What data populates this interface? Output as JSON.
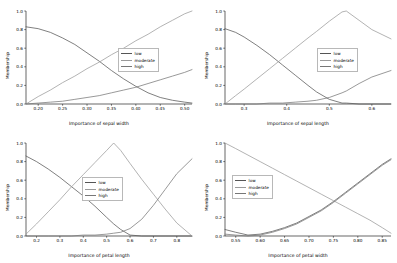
{
  "figure": {
    "background": "#ffffff",
    "layout": "2x2 grid of fuzzy membership function plots"
  },
  "series_colors": {
    "low": "#555555",
    "moderate": "#9a9a9a",
    "high": "#777777"
  },
  "legend_labels": {
    "low": "low",
    "moderate": "moderate",
    "high": "high"
  },
  "chart_data": [
    {
      "id": "top-left",
      "type": "line",
      "title": "",
      "xlabel": "Importance of sepal width",
      "ylabel": "Membership",
      "xlim": [
        0.175,
        0.515
      ],
      "ylim": [
        0.0,
        1.0
      ],
      "xticks": [
        "0.20",
        "0.25",
        "0.30",
        "0.35",
        "0.40",
        "0.45",
        "0.50"
      ],
      "xtick_values": [
        0.2,
        0.25,
        0.3,
        0.35,
        0.4,
        0.45,
        0.5
      ],
      "yticks": [
        "0.0",
        "0.2",
        "0.4",
        "0.6",
        "0.8",
        "1.0"
      ],
      "ytick_values": [
        0.0,
        0.2,
        0.4,
        0.6,
        0.8,
        1.0
      ],
      "grid": false,
      "legend_position": "center-right",
      "x": [
        0.175,
        0.2,
        0.225,
        0.25,
        0.275,
        0.3,
        0.325,
        0.35,
        0.375,
        0.4,
        0.425,
        0.45,
        0.475,
        0.5,
        0.515
      ],
      "series": [
        {
          "name": "low",
          "values": [
            0.83,
            0.81,
            0.77,
            0.71,
            0.64,
            0.55,
            0.46,
            0.36,
            0.27,
            0.19,
            0.12,
            0.07,
            0.04,
            0.02,
            0.01
          ]
        },
        {
          "name": "moderate",
          "values": [
            0.0,
            0.08,
            0.15,
            0.23,
            0.3,
            0.38,
            0.45,
            0.53,
            0.6,
            0.68,
            0.75,
            0.83,
            0.9,
            0.97,
            1.0
          ]
        },
        {
          "name": "high",
          "values": [
            0.0,
            0.01,
            0.02,
            0.03,
            0.05,
            0.07,
            0.09,
            0.12,
            0.15,
            0.18,
            0.22,
            0.26,
            0.3,
            0.34,
            0.37
          ]
        }
      ]
    },
    {
      "id": "top-right",
      "type": "line",
      "title": "",
      "xlabel": "Importance of sepal length",
      "ylabel": "Membership",
      "xlim": [
        0.255,
        0.645
      ],
      "ylim": [
        0.0,
        1.0
      ],
      "xticks": [
        "0.3",
        "0.4",
        "0.5",
        "0.6"
      ],
      "xtick_values": [
        0.3,
        0.4,
        0.5,
        0.6
      ],
      "yticks": [
        "0.0",
        "0.2",
        "0.4",
        "0.6",
        "0.8",
        "1.0"
      ],
      "ytick_values": [
        0.0,
        0.2,
        0.4,
        0.6,
        0.8,
        1.0
      ],
      "grid": false,
      "legend_position": "center-right",
      "x": [
        0.255,
        0.28,
        0.3,
        0.33,
        0.36,
        0.39,
        0.42,
        0.45,
        0.47,
        0.5,
        0.53,
        0.54,
        0.57,
        0.6,
        0.645
      ],
      "series": [
        {
          "name": "low",
          "values": [
            0.81,
            0.77,
            0.72,
            0.63,
            0.53,
            0.42,
            0.31,
            0.2,
            0.13,
            0.05,
            0.01,
            0.01,
            0.0,
            0.0,
            0.0
          ]
        },
        {
          "name": "moderate",
          "values": [
            0.0,
            0.09,
            0.16,
            0.27,
            0.38,
            0.49,
            0.6,
            0.71,
            0.78,
            0.89,
            0.99,
            1.0,
            0.9,
            0.8,
            0.7
          ]
        },
        {
          "name": "high",
          "values": [
            0.0,
            0.0,
            0.0,
            0.0,
            0.01,
            0.01,
            0.02,
            0.03,
            0.04,
            0.07,
            0.12,
            0.14,
            0.22,
            0.29,
            0.36
          ]
        }
      ]
    },
    {
      "id": "bottom-left",
      "type": "line",
      "title": "",
      "xlabel": "Importance of petal length",
      "ylabel": "Membership",
      "xlim": [
        0.155,
        0.865
      ],
      "ylim": [
        0.0,
        1.0
      ],
      "xticks": [
        "0.2",
        "0.3",
        "0.4",
        "0.5",
        "0.6",
        "0.7",
        "0.8"
      ],
      "xtick_values": [
        0.2,
        0.3,
        0.4,
        0.5,
        0.6,
        0.7,
        0.8
      ],
      "yticks": [
        "0.0",
        "0.2",
        "0.4",
        "0.6",
        "0.8",
        "1.0"
      ],
      "ytick_values": [
        0.0,
        0.2,
        0.4,
        0.6,
        0.8,
        1.0
      ],
      "grid": false,
      "legend_position": "center",
      "x": [
        0.155,
        0.2,
        0.25,
        0.3,
        0.35,
        0.4,
        0.45,
        0.5,
        0.53,
        0.56,
        0.6,
        0.65,
        0.7,
        0.75,
        0.8,
        0.865
      ],
      "series": [
        {
          "name": "low",
          "values": [
            0.86,
            0.8,
            0.72,
            0.63,
            0.53,
            0.43,
            0.32,
            0.2,
            0.13,
            0.07,
            0.01,
            0.0,
            0.0,
            0.0,
            0.0,
            0.0
          ]
        },
        {
          "name": "moderate",
          "values": [
            0.02,
            0.13,
            0.26,
            0.39,
            0.53,
            0.66,
            0.79,
            0.92,
            1.0,
            0.92,
            0.78,
            0.61,
            0.45,
            0.29,
            0.14,
            0.0
          ]
        },
        {
          "name": "high",
          "values": [
            0.0,
            0.0,
            0.0,
            0.0,
            0.0,
            0.01,
            0.01,
            0.02,
            0.03,
            0.04,
            0.08,
            0.18,
            0.33,
            0.5,
            0.67,
            0.83
          ]
        }
      ]
    },
    {
      "id": "bottom-right",
      "type": "line",
      "title": "",
      "xlabel": "Importance of petal width",
      "ylabel": "Membership",
      "xlim": [
        0.528,
        0.868
      ],
      "ylim": [
        0.0,
        1.0
      ],
      "xticks": [
        "0.55",
        "0.60",
        "0.65",
        "0.70",
        "0.75",
        "0.80",
        "0.85"
      ],
      "xtick_values": [
        0.55,
        0.6,
        0.65,
        0.7,
        0.75,
        0.8,
        0.85
      ],
      "yticks": [
        "0.0",
        "0.2",
        "0.4",
        "0.6",
        "0.8",
        "1.0"
      ],
      "ytick_values": [
        0.0,
        0.2,
        0.4,
        0.6,
        0.8,
        1.0
      ],
      "grid": false,
      "legend_position": "center-left",
      "x": [
        0.528,
        0.55,
        0.575,
        0.6,
        0.625,
        0.65,
        0.675,
        0.7,
        0.725,
        0.75,
        0.775,
        0.8,
        0.825,
        0.85,
        0.868
      ],
      "series": [
        {
          "name": "low",
          "values": [
            0.07,
            0.04,
            0.01,
            0.02,
            0.05,
            0.09,
            0.14,
            0.21,
            0.28,
            0.37,
            0.47,
            0.57,
            0.67,
            0.77,
            0.83
          ]
        },
        {
          "name": "moderate",
          "values": [
            1.0,
            0.94,
            0.87,
            0.8,
            0.73,
            0.66,
            0.59,
            0.52,
            0.45,
            0.38,
            0.31,
            0.24,
            0.17,
            0.09,
            0.03
          ]
        },
        {
          "name": "high",
          "values": [
            0.02,
            0.01,
            0.0,
            0.01,
            0.04,
            0.08,
            0.13,
            0.2,
            0.27,
            0.36,
            0.46,
            0.56,
            0.66,
            0.76,
            0.82
          ]
        }
      ]
    }
  ]
}
